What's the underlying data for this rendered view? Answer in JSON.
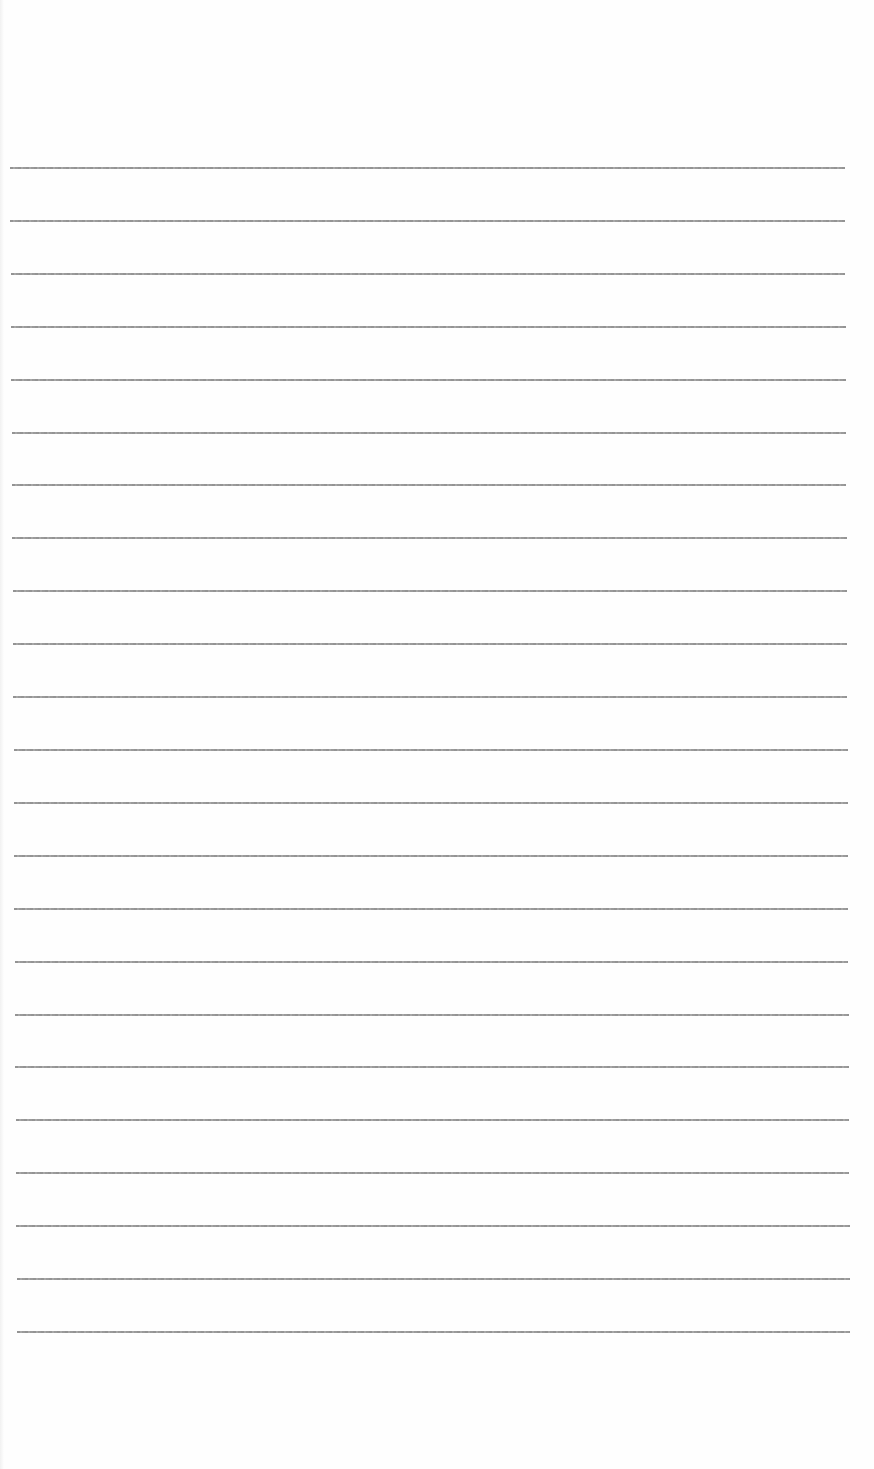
{
  "page": {
    "type": "ruled-sheet",
    "background_color": "#fefefe",
    "rule_color": "#999999",
    "rule_count": 23,
    "rule_spacing_px": 52.9,
    "first_rule_y": 168,
    "last_rule_y": 1332,
    "rules_left_start_x": 10,
    "rules_left_end_x": 17,
    "rules_right_start_x": 845,
    "rules_right_end_x": 850,
    "text": ""
  }
}
